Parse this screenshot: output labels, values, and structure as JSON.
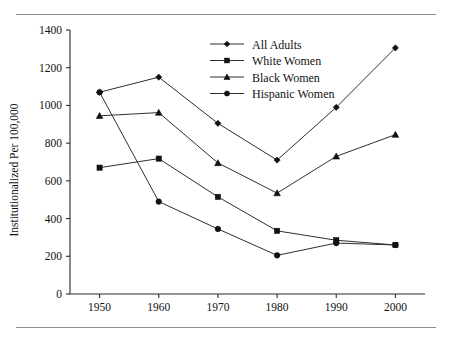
{
  "chart_data": {
    "type": "line",
    "title": "",
    "xlabel": "",
    "ylabel": "Institutionalized Per 100,000",
    "x": [
      1950,
      1960,
      1970,
      1980,
      1990,
      2000
    ],
    "xtick_labels": [
      "1950",
      "1960",
      "1970",
      "1980",
      "1990",
      "2000"
    ],
    "ytick_labels": [
      "0",
      "200",
      "400",
      "600",
      "800",
      "1000",
      "1200",
      "1400"
    ],
    "yticks": [
      0,
      200,
      400,
      600,
      800,
      1000,
      1200,
      1400
    ],
    "ylim": [
      0,
      1400
    ],
    "xlim": [
      1945,
      2005
    ],
    "grid": false,
    "legend_position": "top-center",
    "series": [
      {
        "name": "All Adults",
        "marker": "diamond",
        "values": [
          1070,
          1150,
          905,
          710,
          990,
          1305
        ]
      },
      {
        "name": "White Women",
        "marker": "square",
        "values": [
          670,
          718,
          515,
          335,
          285,
          260
        ]
      },
      {
        "name": "Black Women",
        "marker": "triangle",
        "values": [
          945,
          962,
          695,
          535,
          730,
          845
        ]
      },
      {
        "name": "Hispanic Women",
        "marker": "circle",
        "values": [
          1070,
          490,
          345,
          205,
          270,
          260
        ]
      }
    ]
  }
}
